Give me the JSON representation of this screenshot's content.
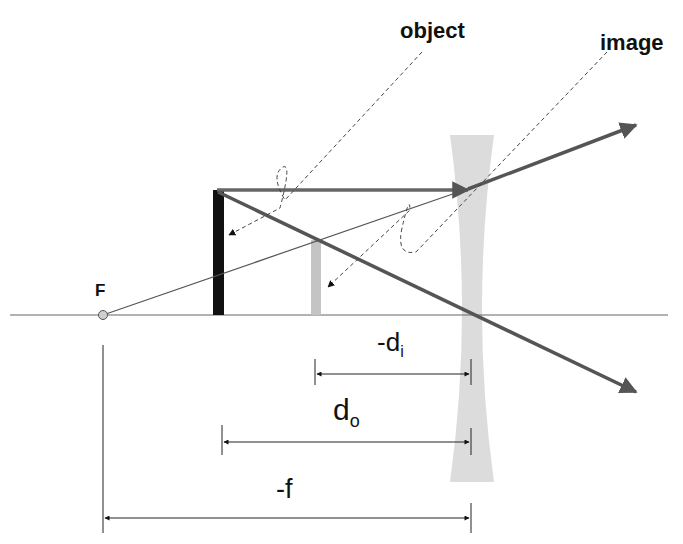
{
  "diagram": {
    "labels": {
      "object": "object",
      "image": "image",
      "focal_point": "F",
      "di_main": "-d",
      "di_sub": "i",
      "do_main": "d",
      "do_sub": "o",
      "f": "-f"
    },
    "colors": {
      "ray": "#555555",
      "object_arrow": "#111111",
      "image_arrow": "#c4c4c4",
      "lens": "#dcdcdc",
      "axis": "#555555",
      "dimension": "#222222",
      "focal_point_fill": "#cfcfcf"
    },
    "elements": [
      "optical-axis",
      "diverging-lens",
      "object",
      "virtual-image",
      "focal-point",
      "parallel-ray",
      "central-ray",
      "virtual-ray-extension",
      "dimension-di",
      "dimension-do",
      "dimension-f"
    ]
  }
}
